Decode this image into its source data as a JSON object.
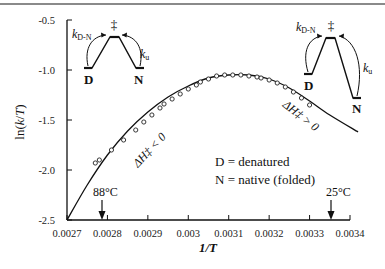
{
  "chart_data": {
    "type": "scatter",
    "title": "",
    "xlabel": "1/T",
    "ylabel": "ln(k/T)",
    "xlim": [
      0.0027,
      0.0034
    ],
    "ylim": [
      -2.5,
      -0.5
    ],
    "x_ticks": [
      "0.0027",
      "0.0028",
      "0.0029",
      "0.003",
      "0.0031",
      "0.0032",
      "0.0033",
      "0.0034"
    ],
    "y_ticks": [
      "-0.5",
      "-1.0",
      "-1.5",
      "-2.0",
      "-2.5"
    ],
    "grid": false,
    "series": [
      {
        "name": "measured",
        "marker": "open-circle",
        "x": [
          0.00277,
          0.00278,
          0.00281,
          0.00284,
          0.00287,
          0.00289,
          0.00291,
          0.00293,
          0.00294,
          0.00296,
          0.00298,
          0.003,
          0.00302,
          0.00303,
          0.00305,
          0.00307,
          0.00309,
          0.00311,
          0.00313,
          0.00315,
          0.00317,
          0.00318,
          0.0032,
          0.00322,
          0.00324,
          0.00326,
          0.00328,
          0.0033
        ],
        "y": [
          -1.93,
          -1.9,
          -1.8,
          -1.7,
          -1.6,
          -1.52,
          -1.45,
          -1.38,
          -1.34,
          -1.29,
          -1.24,
          -1.19,
          -1.15,
          -1.12,
          -1.09,
          -1.06,
          -1.05,
          -1.05,
          -1.05,
          -1.06,
          -1.07,
          -1.08,
          -1.1,
          -1.13,
          -1.17,
          -1.22,
          -1.28,
          -1.35
        ]
      },
      {
        "name": "fit",
        "style": "line",
        "x": [
          0.0027,
          0.00275,
          0.0028,
          0.00285,
          0.0029,
          0.00295,
          0.003,
          0.00305,
          0.0031,
          0.00315,
          0.0032,
          0.00325,
          0.0033,
          0.00335,
          0.00342
        ],
        "y": [
          -2.5,
          -2.15,
          -1.85,
          -1.61,
          -1.42,
          -1.27,
          -1.16,
          -1.08,
          -1.05,
          -1.05,
          -1.09,
          -1.18,
          -1.31,
          -1.45,
          -1.62
        ]
      }
    ],
    "annotations": [
      {
        "text": "88°C",
        "x": 0.00277,
        "arrow": "down"
      },
      {
        "text": "25°C",
        "x": 0.003355,
        "arrow": "down"
      },
      {
        "text": "ΔH‡ < 0",
        "region": "left"
      },
      {
        "text": "ΔH‡ > 0",
        "region": "right"
      }
    ],
    "legend": {
      "position": "lower-right",
      "entries": [
        "D = denatured",
        "N = native (folded)"
      ]
    },
    "insets": [
      {
        "position": "top-left",
        "states": [
          "D",
          "‡",
          "N"
        ],
        "rates": [
          "k_D-N",
          "k_u"
        ],
        "D_level": "low",
        "N_level": "low"
      },
      {
        "position": "top-right",
        "states": [
          "D",
          "‡",
          "N"
        ],
        "rates": [
          "k_D-N",
          "k_u"
        ],
        "D_level": "higher",
        "N_level": "lowest"
      }
    ]
  },
  "labels": {
    "ylabel_main": "ln(",
    "ylabel_k": "k",
    "ylabel_slash": "/",
    "ylabel_T": "T",
    "ylabel_close": ")",
    "xlabel": "1/T",
    "temp_high": "88°C",
    "temp_low": "25°C",
    "dh_neg": "ΔH‡ < 0",
    "dh_pos": "ΔH‡ > 0",
    "legend_d": "D = denatured",
    "legend_n": "N = native (folded)",
    "state_d": "D",
    "state_n": "N",
    "state_ts": "‡",
    "k_letter": "k",
    "k_dn_sub": "D-N",
    "k_u_sub": "u"
  },
  "axis": {
    "x_ticks": [
      "0.0027",
      "0.0028",
      "0.0029",
      "0.003",
      "0.0031",
      "0.0032",
      "0.0033",
      "0.0034"
    ],
    "y_ticks": [
      "-0.5",
      "-1.0",
      "-1.5",
      "-2.0",
      "-2.5"
    ]
  }
}
